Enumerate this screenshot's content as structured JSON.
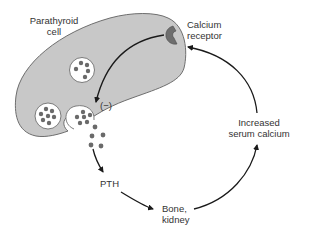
{
  "diagram": {
    "labels": {
      "parathyroid_cell": [
        "Parathyroid",
        "cell"
      ],
      "calcium_receptor": [
        "Calcium",
        "receptor"
      ],
      "inhibition": "(−)",
      "pth": "PTH",
      "bone_kidney": [
        "Bone,",
        "kidney"
      ],
      "increased_serum_calcium": [
        "Increased",
        "serum calcium"
      ]
    },
    "colors": {
      "cell_fill": "#c8c8c8",
      "cell_outline": "#6e6e6e",
      "receptor_fill": "#6e6e6e",
      "granule_fill": "#6a6a6a",
      "vesicle_fill": "#ffffff",
      "arrow": "#1a1a1a",
      "text": "#333333"
    },
    "nodes": [
      {
        "id": "parathyroid-cell",
        "label": "Parathyroid cell"
      },
      {
        "id": "calcium-receptor",
        "label": "Calcium receptor"
      },
      {
        "id": "pth",
        "label": "PTH"
      },
      {
        "id": "bone-kidney",
        "label": "Bone, kidney"
      },
      {
        "id": "increased-serum-calcium",
        "label": "Increased serum calcium"
      }
    ],
    "edges": [
      {
        "from": "calcium-receptor",
        "to": "secretory-vesicle",
        "label": "(−)",
        "type": "inhibition"
      },
      {
        "from": "parathyroid-cell",
        "to": "pth",
        "type": "secretion"
      },
      {
        "from": "pth",
        "to": "bone-kidney"
      },
      {
        "from": "bone-kidney",
        "to": "increased-serum-calcium"
      },
      {
        "from": "increased-serum-calcium",
        "to": "calcium-receptor"
      }
    ]
  }
}
